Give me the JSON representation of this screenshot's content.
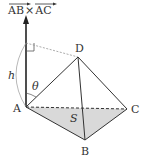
{
  "diagram": {
    "title_label": "AB×AC",
    "vector_label_parts": [
      "AB",
      "×",
      "AC"
    ],
    "points": {
      "A": {
        "label": "A",
        "x": 26,
        "y": 107
      },
      "B": {
        "label": "B",
        "x": 85,
        "y": 140
      },
      "C": {
        "label": "C",
        "x": 127,
        "y": 109
      },
      "D": {
        "label": "D",
        "x": 78,
        "y": 57
      }
    },
    "height_label": "h",
    "angle_label": "θ",
    "area_label": "S",
    "colors": {
      "line": "#333333",
      "dashed": "#444444",
      "fill": "#d9d9d9",
      "arc": "#999999"
    }
  }
}
